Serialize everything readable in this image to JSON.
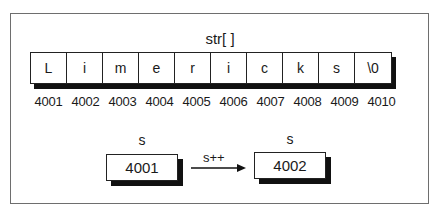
{
  "array": {
    "title": "str[ ]",
    "cells": [
      "L",
      "i",
      "m",
      "e",
      "r",
      "i",
      "c",
      "k",
      "s",
      "\\0"
    ],
    "addresses": [
      "4001",
      "4002",
      "4003",
      "4004",
      "4005",
      "4006",
      "4007",
      "4008",
      "4009",
      "4010"
    ]
  },
  "pointer": {
    "before": {
      "label": "s",
      "value": "4001"
    },
    "operation": "s++",
    "after": {
      "label": "s",
      "value": "4002"
    }
  }
}
